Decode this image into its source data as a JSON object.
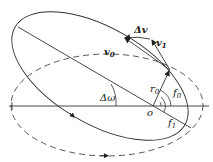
{
  "diagram": {
    "type": "orbit-plane-change",
    "colors": {
      "stroke": "#333333",
      "background": "#ffffff"
    },
    "labels": {
      "delta_v": "Δv",
      "v0": "v",
      "v0_sub": "0",
      "v1": "v",
      "v1_sub": "1",
      "r0": "r",
      "r0_sub": "0",
      "f0": "f",
      "f0_sub": "0",
      "f1": "f",
      "f1_sub": "1",
      "delta_omega": "Δω",
      "origin": "o"
    },
    "elements": {
      "solid_orbit": "tilted ellipse (new orbit)",
      "dashed_orbit": "original orbit ellipse",
      "reference_axis": "horizontal line through o",
      "apsidal_line": "line of apsides of new orbit"
    }
  }
}
